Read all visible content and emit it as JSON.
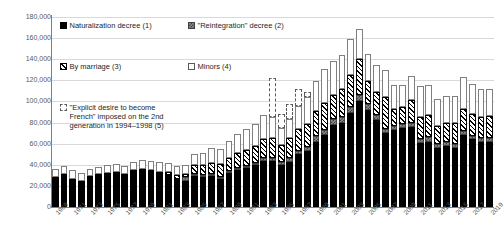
{
  "chart_data": {
    "type": "bar",
    "stacked": true,
    "title": "",
    "xlabel": "",
    "ylabel": "",
    "ylim": [
      0,
      180000
    ],
    "ytick_step": 20000,
    "ytick_labels": [
      "0",
      "20,000",
      "40,000",
      "60,000",
      "80,000",
      "100,000",
      "120,000",
      "140,000",
      "160,000",
      "180,000"
    ],
    "grid": true,
    "legend_position": "inside-top-left",
    "x_tick_interval": 2,
    "x_first_label": 1969,
    "categories": [
      "1969",
      "1970",
      "1971",
      "1972",
      "1973",
      "1974",
      "1975",
      "1976",
      "1977",
      "1978",
      "1979",
      "1980",
      "1981",
      "1982",
      "1983",
      "1984",
      "1985",
      "1986",
      "1987",
      "1988",
      "1989",
      "1990",
      "1991",
      "1992",
      "1993",
      "1994",
      "1995",
      "1996",
      "1997",
      "1998",
      "1999",
      "2000",
      "2001",
      "2002",
      "2003",
      "2004",
      "2005",
      "2006",
      "2007",
      "2008",
      "2009",
      "2010",
      "2011",
      "2012",
      "2013",
      "2014",
      "2015",
      "2016",
      "2017",
      "2018",
      "2019"
    ],
    "tick_labels": [
      "1969",
      "1971",
      "1973",
      "1975",
      "1977",
      "1979",
      "1981",
      "1983",
      "1985",
      "1987",
      "1989",
      "1991",
      "1993",
      "1995",
      "1997",
      "1999",
      "2001",
      "2003",
      "2005",
      "2007",
      "2009",
      "2011",
      "2013",
      "2015",
      "2017",
      "2019"
    ],
    "series": [
      {
        "name": "Naturalization decree (1)",
        "key": "naturalization",
        "pattern": "solid-black",
        "color": "#000000",
        "values": [
          28000,
          31000,
          27000,
          25000,
          29000,
          31000,
          32000,
          33000,
          31000,
          33000,
          34000,
          33000,
          31000,
          30000,
          27000,
          25000,
          29000,
          28000,
          29000,
          27000,
          32000,
          35000,
          37000,
          40000,
          44000,
          44000,
          40000,
          43000,
          50000,
          53000,
          62000,
          68000,
          78000,
          80000,
          89000,
          100000,
          92000,
          82000,
          70000,
          73000,
          75000,
          76000,
          61000,
          62000,
          56000,
          58000,
          56000,
          68000,
          64000,
          62000,
          62000
        ]
      },
      {
        "name": "\"Reintegration\" decree (2)",
        "key": "reintegration",
        "pattern": "checker-gray",
        "color": "#8c8c8c",
        "values": [
          0,
          0,
          0,
          0,
          0,
          0,
          0,
          0,
          0,
          0,
          0,
          0,
          0,
          0,
          0,
          3000,
          1500,
          1000,
          1000,
          1000,
          1500,
          1500,
          2000,
          2000,
          2000,
          2500,
          2500,
          3000,
          3500,
          4000,
          5000,
          5000,
          5500,
          5500,
          6000,
          6500,
          6000,
          5000,
          4000,
          4000,
          4000,
          4000,
          3500,
          4000,
          3500,
          3500,
          3500,
          4000,
          3500,
          3500,
          3500
        ]
      },
      {
        "name": "By marriage (3)",
        "key": "marriage",
        "pattern": "diagonal-hatch",
        "color": "#000000",
        "values": [
          0,
          0,
          0,
          0,
          0,
          0,
          0,
          0,
          0,
          1000,
          1500,
          2000,
          2500,
          3000,
          3000,
          3500,
          9000,
          10000,
          11000,
          12000,
          13000,
          14000,
          15000,
          16000,
          18000,
          19000,
          16000,
          19000,
          20000,
          22000,
          24000,
          26000,
          23000,
          26000,
          30000,
          34000,
          21000,
          22000,
          30000,
          16000,
          16000,
          21000,
          21000,
          21000,
          17000,
          18000,
          20000,
          21000,
          21000,
          20000,
          21000
        ]
      },
      {
        "name": "Minors (4)",
        "key": "minors",
        "pattern": "white-outline",
        "color": "#ffffff",
        "values": [
          8000,
          8000,
          8000,
          7000,
          7000,
          7000,
          8000,
          8000,
          8000,
          8000,
          9000,
          9000,
          9000,
          9000,
          9000,
          8000,
          10000,
          11000,
          14000,
          14000,
          16000,
          18000,
          20000,
          21000,
          23000,
          20000,
          16000,
          18000,
          22000,
          25000,
          28000,
          32000,
          32000,
          33000,
          34000,
          28000,
          26000,
          26000,
          26000,
          23000,
          21000,
          23000,
          29000,
          29000,
          26000,
          26000,
          26000,
          30000,
          28000,
          26000,
          25000
        ]
      },
      {
        "name": "\"Explicit desire to become French\" imposed on the 2nd generation in 1994–1998 (5)",
        "key": "explicit_desire",
        "pattern": "dashed-outline",
        "color": "#ffffff",
        "values": [
          0,
          0,
          0,
          0,
          0,
          0,
          0,
          0,
          0,
          0,
          0,
          0,
          0,
          0,
          0,
          0,
          0,
          0,
          0,
          0,
          0,
          0,
          0,
          0,
          0,
          37000,
          14000,
          15000,
          16000,
          5000,
          0,
          0,
          0,
          0,
          0,
          0,
          0,
          0,
          0,
          0,
          0,
          0,
          0,
          0,
          0,
          0,
          0,
          0,
          0,
          0,
          0
        ]
      }
    ]
  },
  "legend": {
    "items": [
      {
        "label": "Naturalization decree (1)",
        "swatch": "sw-natur",
        "name": "legend-naturalization"
      },
      {
        "label": "\"Reintegration\" decree (2)",
        "swatch": "sw-reint",
        "name": "legend-reintegration"
      },
      {
        "label": "By marriage (3)",
        "swatch": "sw-marri",
        "name": "legend-marriage"
      },
      {
        "label": "Minors (4)",
        "swatch": "sw-minor",
        "name": "legend-minors"
      },
      {
        "label": "\"Explicit desire to become\nFrench\" imposed on the 2nd\ngeneration in 1994–1998 (5)",
        "swatch": "sw-expli",
        "name": "legend-explicit-desire"
      }
    ]
  }
}
